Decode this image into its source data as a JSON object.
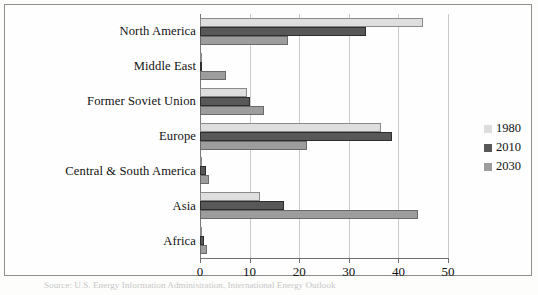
{
  "chart_data": {
    "type": "bar",
    "orientation": "horizontal",
    "title": "",
    "xlabel": "",
    "ylabel": "",
    "xlim": [
      0,
      50
    ],
    "xticks": [
      0,
      10,
      20,
      30,
      40,
      50
    ],
    "xtick_labels": [
      "0",
      "10",
      "20",
      "30",
      "40",
      "50"
    ],
    "grid": true,
    "legend_position": "right",
    "categories": [
      "North America",
      "Middle East",
      "Former Soviet Union",
      "Europe",
      "Central & South America",
      "Asia",
      "Africa"
    ],
    "series": [
      {
        "name": "1980",
        "color": "#dedede",
        "values": [
          45.0,
          0.3,
          9.5,
          36.5,
          0.5,
          12.0,
          0.3
        ]
      },
      {
        "name": "2010",
        "color": "#585858",
        "values": [
          33.5,
          0.5,
          10.0,
          38.7,
          1.3,
          17.0,
          0.8
        ]
      },
      {
        "name": "2030",
        "color": "#9d9d9d",
        "values": [
          17.7,
          5.2,
          13.0,
          21.5,
          1.8,
          44.0,
          1.5
        ]
      }
    ]
  },
  "legend": {
    "entries": [
      {
        "label": "1980",
        "swatch_class": "s1980"
      },
      {
        "label": "2010",
        "swatch_class": "s2010"
      },
      {
        "label": "2030",
        "swatch_class": "s2030"
      }
    ]
  },
  "caption": {
    "text": "Source: U.S. Energy Information Administration, International Energy Outlook"
  }
}
